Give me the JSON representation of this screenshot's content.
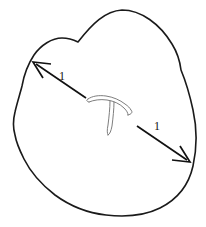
{
  "figure": {
    "background_color": "#ffffff",
    "outline_color": "#1a1a1a",
    "squiggle_color": "#6f6f6f",
    "arrow_color": "#111111",
    "canvas": {
      "width": 206,
      "height": 227
    }
  },
  "region": {
    "name": "blob-boundary",
    "description": "closed irregular blob outline with two concave cusps",
    "bounds": {
      "left": 13,
      "top": 10,
      "right": 197,
      "bottom": 216
    }
  },
  "center_shape": {
    "name": "curve-squiggle",
    "description": "small thin outlined hooked T shape near the centre"
  },
  "arrows": [
    {
      "id": "arrow-upper-left",
      "label": "1",
      "direction": "up-left",
      "tail": {
        "x": 86,
        "y": 98
      },
      "tip": {
        "x": 33,
        "y": 62
      },
      "label_position": {
        "x": 62,
        "y": 80
      }
    },
    {
      "id": "arrow-lower-right",
      "label": "1",
      "direction": "down-right",
      "tail": {
        "x": 137,
        "y": 126
      },
      "tip": {
        "x": 190,
        "y": 162
      },
      "label_position": {
        "x": 156,
        "y": 135
      }
    }
  ]
}
